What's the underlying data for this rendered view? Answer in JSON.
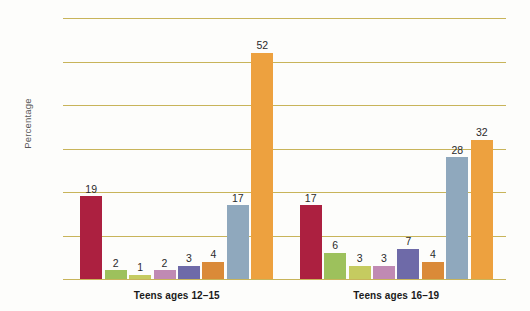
{
  "chart_data": {
    "type": "bar",
    "title": "",
    "xlabel": "",
    "ylabel": "Percentage",
    "ylim": [
      0,
      60
    ],
    "yticks": [
      0,
      10,
      20,
      30,
      40,
      50,
      60
    ],
    "ytick_labels": [
      "0",
      "10",
      "20",
      "30",
      "40",
      "50",
      "60"
    ],
    "grid": true,
    "legend": "none",
    "categories": [
      "Teens ages 12–15",
      "Teens ages 16–19"
    ],
    "groups": [
      {
        "label": "Teens ages 12–15",
        "bars": [
          {
            "value": 19,
            "label": "19",
            "color": "#ac2040"
          },
          {
            "value": 2,
            "label": "2",
            "color": "#9dc15c"
          },
          {
            "value": 1,
            "label": "1",
            "color": "#c5cb60"
          },
          {
            "value": 2,
            "label": "2",
            "color": "#c08ab3"
          },
          {
            "value": 3,
            "label": "3",
            "color": "#6e6aa8"
          },
          {
            "value": 4,
            "label": "4",
            "color": "#da8a38"
          },
          {
            "value": 17,
            "label": "17",
            "color": "#8fa8bd"
          },
          {
            "value": 52,
            "label": "52",
            "color": "#eda13f"
          }
        ]
      },
      {
        "label": "Teens ages 16–19",
        "bars": [
          {
            "value": 17,
            "label": "17",
            "color": "#ac2040"
          },
          {
            "value": 6,
            "label": "6",
            "color": "#9dc15c"
          },
          {
            "value": 3,
            "label": "3",
            "color": "#c5cb60"
          },
          {
            "value": 3,
            "label": "3",
            "color": "#c08ab3"
          },
          {
            "value": 7,
            "label": "7",
            "color": "#6e6aa8"
          },
          {
            "value": 4,
            "label": "4",
            "color": "#da8a38"
          },
          {
            "value": 28,
            "label": "28",
            "color": "#8fa8bd"
          },
          {
            "value": 32,
            "label": "32",
            "color": "#eda13f"
          }
        ]
      }
    ],
    "colors": {
      "gridline": "#c8b45a",
      "background": "#fdfdfb",
      "value_text": "#2b2b2b",
      "tick_text": "#4a4a4a"
    }
  }
}
